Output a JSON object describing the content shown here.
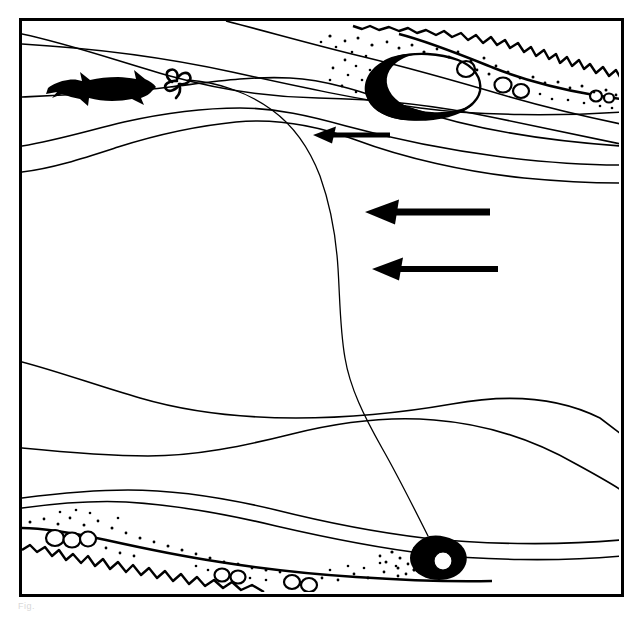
{
  "figure": {
    "background_color": "#ffffff",
    "ink_color": "#000000",
    "border": {
      "name": "figure-frame",
      "x": 19,
      "y": 18,
      "width": 602,
      "height": 576,
      "stroke_width": 3
    },
    "caption_fragment": "Fig."
  },
  "elements": {
    "fish": {
      "label": "fish-silhouette",
      "facing": "right",
      "x": 48,
      "y": 68,
      "width": 105,
      "height": 35,
      "fill": "#000000"
    },
    "float_knot": {
      "label": "float-knot",
      "x": 164,
      "y": 75,
      "width": 28,
      "height": 26
    },
    "boulder": {
      "label": "boulder-rock",
      "x": 364,
      "y": 56,
      "width": 112,
      "height": 62,
      "shading": "crescent-left"
    },
    "lure": {
      "label": "weighted-lure",
      "x": 404,
      "y": 535,
      "width": 58,
      "height": 44,
      "fill": "#000000",
      "has_white_eye": true
    },
    "fishing_line": {
      "label": "fishing-line",
      "from": "float-knot",
      "to": "weighted-lure",
      "stroke_width": 1.2
    }
  },
  "current_arrows": [
    {
      "name": "current-arrow-small",
      "direction": "left",
      "tip_x": 313,
      "tail_x": 390,
      "y": 135,
      "length": 77,
      "shaft_width": 5,
      "head_width": 17
    },
    {
      "name": "current-arrow-main-upper",
      "direction": "left",
      "tip_x": 365,
      "tail_x": 490,
      "y": 212,
      "length": 125,
      "shaft_width": 7,
      "head_width": 25
    },
    {
      "name": "current-arrow-main-lower",
      "direction": "left",
      "tip_x": 372,
      "tail_x": 498,
      "y": 269,
      "length": 126,
      "shaft_width": 6,
      "head_width": 23
    }
  ],
  "current_seams": [
    {
      "name": "seam-line-1",
      "region": "upper",
      "note": "upper bank seam sweeping right and down"
    },
    {
      "name": "seam-line-2",
      "region": "upper",
      "note": "second upper seam"
    },
    {
      "name": "seam-line-3",
      "region": "upper-mid",
      "note": "broad mid seam through fish lie"
    },
    {
      "name": "seam-line-4",
      "region": "mid",
      "note": "long slack water margin"
    },
    {
      "name": "seam-line-5",
      "region": "lower-mid",
      "note": "lower seam curving to right bank"
    },
    {
      "name": "seam-line-6",
      "region": "lower-mid",
      "note": "parallel lower seam"
    },
    {
      "name": "seam-line-7",
      "region": "lower",
      "note": "near-bank seam above gravel"
    },
    {
      "name": "seam-line-8",
      "region": "lower",
      "note": "gravel bar edge"
    }
  ],
  "banks": [
    {
      "name": "upper-right-bank",
      "position": "top-right",
      "features": [
        "jagged-bank-edge",
        "pebbles",
        "sand-stipple"
      ],
      "pebble_count": 5
    },
    {
      "name": "lower-left-bank",
      "position": "bottom-left",
      "features": [
        "jagged-bank-edge",
        "pebbles",
        "sand-stipple"
      ],
      "pebble_count": 7
    }
  ],
  "legend": {
    "fish_label": "Fish",
    "rock_label": "Boulder",
    "lure_label": "Lure",
    "flow_label": "Current"
  }
}
